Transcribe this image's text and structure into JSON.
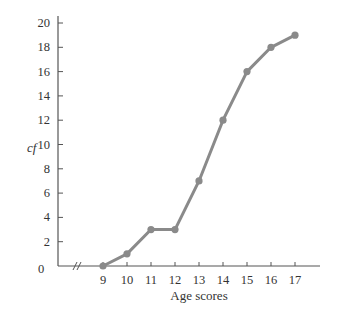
{
  "chart_data": {
    "type": "line",
    "title": "",
    "xlabel": "Age scores",
    "ylabel": "cf",
    "x": [
      9,
      10,
      11,
      12,
      13,
      14,
      15,
      16,
      17
    ],
    "series": [
      {
        "name": "cumulative frequency",
        "values": [
          0,
          1,
          3,
          3,
          7,
          12,
          16,
          18,
          19
        ]
      }
    ],
    "x_ticks": [
      "9",
      "10",
      "11",
      "12",
      "13",
      "14",
      "15",
      "16",
      "17"
    ],
    "y_ticks": [
      "2",
      "4",
      "6",
      "8",
      "10",
      "12",
      "14",
      "16",
      "18",
      "20"
    ],
    "origin_label": "0",
    "axis_break": "//",
    "ylim": [
      0,
      20
    ],
    "xlim": [
      9,
      17
    ],
    "grid": false,
    "legend": "none",
    "colors": {
      "line": "#8a8a8a",
      "axis": "#555555",
      "text": "#333333"
    }
  }
}
